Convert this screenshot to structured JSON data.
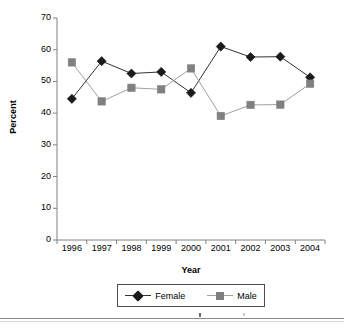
{
  "chart_data": {
    "type": "line",
    "title": "",
    "xlabel": "Year",
    "ylabel": "Percent",
    "categories": [
      "1996",
      "1997",
      "1998",
      "1999",
      "2000",
      "2001",
      "2002",
      "2003",
      "2004"
    ],
    "x": [
      1996,
      1997,
      1998,
      1999,
      2000,
      2001,
      2002,
      2003,
      2004
    ],
    "series": [
      {
        "name": "Female",
        "marker": "diamond",
        "color": "#1a1a1a",
        "line_color": "#333333",
        "values": [
          44.5,
          56.4,
          52.5,
          53.0,
          46.4,
          61.0,
          57.7,
          57.8,
          51.3
        ]
      },
      {
        "name": "Male",
        "marker": "square",
        "color": "#808080",
        "line_color": "#a0a0a0",
        "values": [
          56.0,
          43.7,
          48.0,
          47.5,
          54.1,
          39.1,
          42.6,
          42.7,
          49.3
        ]
      }
    ],
    "ylim": [
      0,
      70
    ],
    "ytick_step": 10,
    "yticks": [
      "0",
      "10",
      "20",
      "30",
      "40",
      "50",
      "60",
      "70"
    ],
    "grid": false,
    "legend_position": "bottom",
    "legend_entries": [
      "Female",
      "Male"
    ]
  },
  "axes": {
    "y_title": "Percent",
    "x_title": "Year"
  },
  "legend": {
    "female_label": "Female",
    "male_label": "Male"
  }
}
